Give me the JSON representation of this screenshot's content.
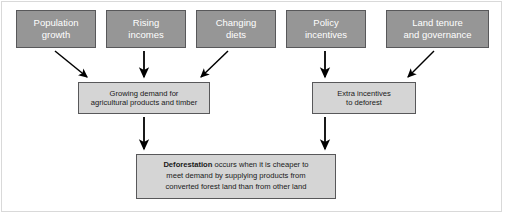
{
  "diagram": {
    "colors": {
      "driver_fill": "#969696",
      "driver_text": "#ffffff",
      "box_fill": "#d5d5d5",
      "box_text": "#1a1a1a",
      "border": "#58585a",
      "arrow": "#000000",
      "frame": "#d9d9d9",
      "background": "#ffffff"
    },
    "drivers": [
      {
        "id": "population-growth",
        "label": "Population\ngrowth",
        "x": 16,
        "y": 10,
        "w": 80,
        "h": 38
      },
      {
        "id": "rising-incomes",
        "label": "Rising\nincomes",
        "x": 106,
        "y": 10,
        "w": 80,
        "h": 38
      },
      {
        "id": "changing-diets",
        "label": "Changing\ndiets",
        "x": 196,
        "y": 10,
        "w": 80,
        "h": 38
      },
      {
        "id": "policy-incentives",
        "label": "Policy\nincentives",
        "x": 286,
        "y": 10,
        "w": 80,
        "h": 38
      },
      {
        "id": "land-tenure-and-governance",
        "label": "Land tenure\nand governance",
        "x": 386,
        "y": 10,
        "w": 103,
        "h": 38
      }
    ],
    "intermediates": [
      {
        "id": "growing-demand",
        "label": "Growing demand for\nagricultural products and timber",
        "x": 78,
        "y": 82,
        "w": 132,
        "h": 32
      },
      {
        "id": "extra-incentives",
        "label": "Extra incentives\nto deforest",
        "x": 312,
        "y": 82,
        "w": 104,
        "h": 32
      }
    ],
    "outcome": {
      "id": "deforestation",
      "bold_term": "Deforestation",
      "rest_line1": " occurs when it is cheaper to",
      "line2": "meet demand by supplying products from",
      "line3": "converted forest land than from other land",
      "x": 136,
      "y": 154,
      "w": 200,
      "h": 45
    },
    "arrows": [
      {
        "id": "arrow-population-to-demand",
        "from": "population-growth",
        "to": "growing-demand",
        "kind": "diagonal-down-right"
      },
      {
        "id": "arrow-income-to-demand",
        "from": "rising-incomes",
        "to": "growing-demand",
        "kind": "vertical-down"
      },
      {
        "id": "arrow-diets-to-demand",
        "from": "changing-diets",
        "to": "growing-demand",
        "kind": "diagonal-down-left"
      },
      {
        "id": "arrow-policy-to-incentives",
        "from": "policy-incentives",
        "to": "extra-incentives",
        "kind": "vertical-down"
      },
      {
        "id": "arrow-tenure-to-incentives",
        "from": "land-tenure-and-governance",
        "to": "extra-incentives",
        "kind": "diagonal-down-left"
      },
      {
        "id": "arrow-demand-to-deforestation",
        "from": "growing-demand",
        "to": "deforestation",
        "kind": "vertical-down"
      },
      {
        "id": "arrow-incentives-to-deforestation",
        "from": "extra-incentives",
        "to": "deforestation",
        "kind": "vertical-down"
      }
    ]
  }
}
